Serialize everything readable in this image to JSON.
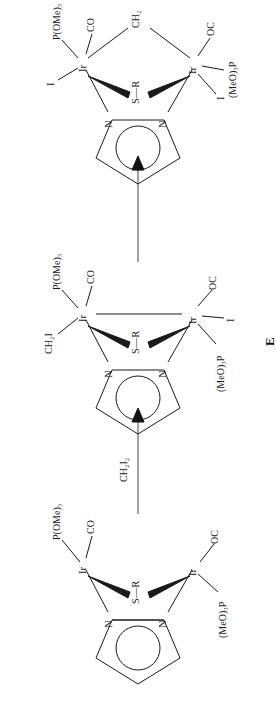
{
  "scheme": {
    "title": "Reaction scheme of dinuclear iridium pyrazolate-thiolate complexes",
    "ink_color": "#1a1a1a",
    "background": "#ffffff"
  },
  "arrows": [
    {
      "name": "arrow-1",
      "reagent": "CH2I2",
      "reagent_display": "CH₂I₂",
      "direction": "right"
    },
    {
      "name": "arrow-2",
      "reagent": "",
      "reagent_display": "",
      "direction": "right"
    }
  ],
  "structures": [
    {
      "id": "structure-1",
      "compound_label": "",
      "ring": {
        "type": "pyrazolate",
        "atoms": [
          "N",
          "N"
        ],
        "aromatic_circle": true
      },
      "bridge": {
        "atom": "S",
        "substituent": "R",
        "display": "S—R"
      },
      "metals": [
        {
          "id": "ir-top",
          "symbol": "Ir",
          "ligands": [
            {
              "label": "P(OMe)3",
              "display": "P(OMe)₃"
            },
            {
              "label": "CO",
              "display": "CO"
            }
          ]
        },
        {
          "id": "ir-bottom",
          "symbol": "Ir",
          "ligands": [
            {
              "label": "(MeO)3P",
              "display": "(MeO)₃P"
            },
            {
              "label": "OC",
              "display": "OC"
            }
          ]
        }
      ],
      "metal_metal_bond": false,
      "ch2_bridge": false
    },
    {
      "id": "structure-2",
      "compound_label": "E",
      "ring": {
        "type": "pyrazolate",
        "atoms": [
          "N",
          "N"
        ],
        "aromatic_circle": true
      },
      "bridge": {
        "atom": "S",
        "substituent": "R",
        "display": "S—R"
      },
      "metals": [
        {
          "id": "ir-top",
          "symbol": "Ir",
          "ligands": [
            {
              "label": "CH2I",
              "display": "CH₂I"
            },
            {
              "label": "P(OMe)3",
              "display": "P(OMe)₃"
            },
            {
              "label": "CO",
              "display": "CO"
            }
          ]
        },
        {
          "id": "ir-bottom",
          "symbol": "Ir",
          "ligands": [
            {
              "label": "(MeO)3P",
              "display": "(MeO)₃P"
            },
            {
              "label": "I",
              "display": "I"
            },
            {
              "label": "OC",
              "display": "OC"
            }
          ]
        }
      ],
      "metal_metal_bond": true,
      "ch2_bridge": false
    },
    {
      "id": "structure-3",
      "compound_label": "",
      "ring": {
        "type": "pyrazolate",
        "atoms": [
          "N",
          "N"
        ],
        "aromatic_circle": true
      },
      "bridge": {
        "atom": "S",
        "substituent": "R",
        "display": "S—R"
      },
      "metals": [
        {
          "id": "ir-top",
          "symbol": "Ir",
          "ligands": [
            {
              "label": "I",
              "display": "I"
            },
            {
              "label": "P(OMe)3",
              "display": "P(OMe)₃"
            },
            {
              "label": "CO",
              "display": "CO"
            }
          ]
        },
        {
          "id": "ir-bottom",
          "symbol": "Ir",
          "ligands": [
            {
              "label": "I",
              "display": "I"
            },
            {
              "label": "(MeO)3P",
              "display": "(MeO)₃P"
            },
            {
              "label": "OC",
              "display": "OC"
            }
          ]
        }
      ],
      "metal_metal_bond": false,
      "ch2_bridge": true,
      "ch2_bridge_label": "CH2",
      "ch2_bridge_display": "CH₂"
    }
  ]
}
